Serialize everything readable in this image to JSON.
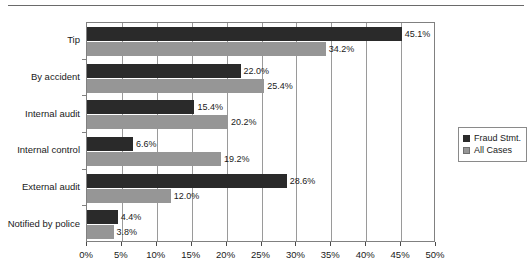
{
  "chart_data": {
    "type": "bar",
    "orientation": "horizontal",
    "title": "",
    "xlabel": "",
    "ylabel": "",
    "xlim": [
      0,
      50
    ],
    "xtick_labels": [
      "0%",
      "5%",
      "10%",
      "15%",
      "20%",
      "25%",
      "30%",
      "35%",
      "40%",
      "45%",
      "50%"
    ],
    "xticks": [
      0,
      5,
      10,
      15,
      20,
      25,
      30,
      35,
      40,
      45,
      50
    ],
    "grid": true,
    "legend_position": "right",
    "categories": [
      "Tip",
      "By accident",
      "Internal audit",
      "Internal control",
      "External audit",
      "Notified by police"
    ],
    "series": [
      {
        "name": "Fraud Stmt.",
        "color": "#2a2a2a",
        "values": [
          45.1,
          22.0,
          15.4,
          6.6,
          28.6,
          4.4
        ],
        "labels": [
          "45.1%",
          "22.0%",
          "15.4%",
          "6.6%",
          "28.6%",
          "4.4%"
        ]
      },
      {
        "name": "All Cases",
        "color": "#969696",
        "values": [
          34.2,
          25.4,
          20.2,
          19.2,
          12.0,
          3.8
        ],
        "labels": [
          "34.2%",
          "25.4%",
          "20.2%",
          "19.2%",
          "12.0%",
          "3.8%"
        ]
      }
    ]
  },
  "legend": {
    "items": [
      {
        "label": "Fraud Stmt.",
        "swatch": "fraud"
      },
      {
        "label": "All Cases",
        "swatch": "all"
      }
    ]
  }
}
